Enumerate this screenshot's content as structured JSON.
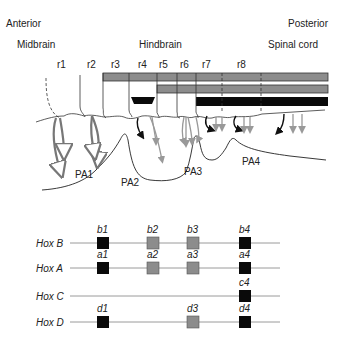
{
  "orientation": {
    "anterior": "Anterior",
    "posterior": "Posterior"
  },
  "regions": {
    "midbrain": "Midbrain",
    "hindbrain": "Hindbrain",
    "spinal_cord": "Spinal cord"
  },
  "rhombomeres": [
    "r1",
    "r2",
    "r3",
    "r4",
    "r5",
    "r6",
    "r7",
    "r8"
  ],
  "pharyngeal_arches": [
    "PA1",
    "PA2",
    "PA3",
    "PA4"
  ],
  "expression_bars": [
    {
      "name": "bar-1",
      "start": "r3",
      "color": "#8a8a8a"
    },
    {
      "name": "bar-2",
      "start": "r5",
      "color": "#8a8a8a"
    },
    {
      "name": "bar-3",
      "start": "r7",
      "color": "#0a0a0a",
      "extra_segment": "r4"
    }
  ],
  "hox_clusters": [
    {
      "label": "Hox B",
      "genes": [
        {
          "name": "b1",
          "shade": "black"
        },
        {
          "name": "b2",
          "shade": "gray"
        },
        {
          "name": "b3",
          "shade": "gray"
        },
        {
          "name": "b4",
          "shade": "black"
        }
      ]
    },
    {
      "label": "Hox A",
      "genes": [
        {
          "name": "a1",
          "shade": "black"
        },
        {
          "name": "a2",
          "shade": "gray"
        },
        {
          "name": "a3",
          "shade": "gray"
        },
        {
          "name": "a4",
          "shade": "black"
        }
      ]
    },
    {
      "label": "Hox C",
      "genes": [
        {
          "name": "c4",
          "shade": "black"
        }
      ]
    },
    {
      "label": "Hox D",
      "genes": [
        {
          "name": "d1",
          "shade": "black"
        },
        {
          "name": "d3",
          "shade": "gray"
        },
        {
          "name": "d4",
          "shade": "black"
        }
      ]
    }
  ],
  "direction": {
    "left": "3′",
    "right": "5′"
  },
  "colors": {
    "gray": "#8c8c8c",
    "black": "#0a0a0a",
    "line": "#9a9a9a",
    "outline": "#333333"
  }
}
